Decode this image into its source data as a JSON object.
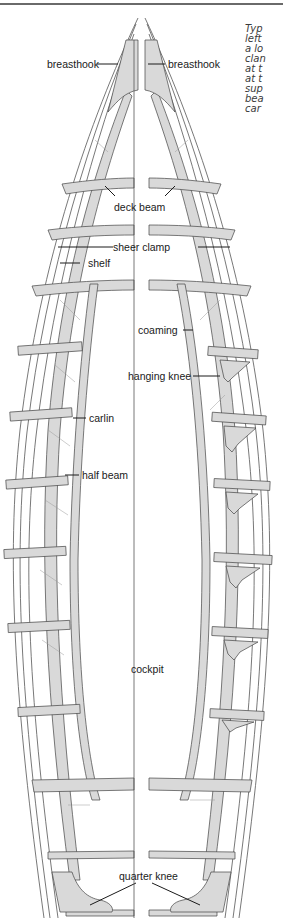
{
  "caption": {
    "lines": [
      "Typ",
      "left",
      "a lo",
      "clan",
      "at t",
      "at t",
      "sup",
      "bea",
      "car"
    ]
  },
  "labels": {
    "breasthook_left": "breasthook",
    "breasthook_right": "breasthook",
    "deck_beam": "deck beam",
    "sheer_clamp": "sheer clamp",
    "shelf": "shelf",
    "coaming": "coaming",
    "hanging_knee": "hanging knee",
    "carlin": "carlin",
    "half_beam": "half beam",
    "cockpit": "cockpit",
    "quarter_knee": "quarter knee"
  },
  "colors": {
    "structure_fill": "#d9d9d9",
    "outline": "#3c3c3c",
    "background": "#ffffff"
  }
}
